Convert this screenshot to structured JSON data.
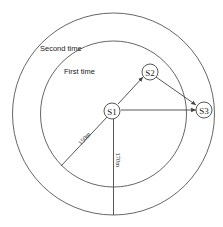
{
  "diagram": {
    "rings": [
      {
        "id": "outer",
        "label": "Second time",
        "radius_label": "170m"
      },
      {
        "id": "inner",
        "label": "First time",
        "radius_label": "150m"
      }
    ],
    "nodes": [
      {
        "id": "S1",
        "label": "S1"
      },
      {
        "id": "S2",
        "label": "S2"
      },
      {
        "id": "S3",
        "label": "S3"
      }
    ],
    "edges": [
      {
        "from": "S1",
        "to": "S2",
        "directed": true
      },
      {
        "from": "S2",
        "to": "S3",
        "directed": true
      },
      {
        "from": "S1",
        "to": "S3",
        "directed": true
      }
    ],
    "colors": {
      "stroke": "#444444",
      "background": "#ffffff"
    }
  }
}
